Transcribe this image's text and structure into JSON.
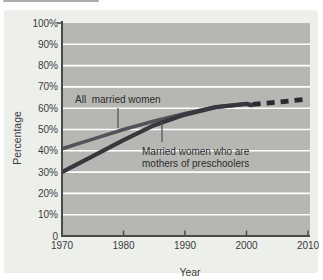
{
  "chart_data": {
    "type": "line",
    "title": "",
    "xlabel": "Year",
    "ylabel": "Percentage",
    "xlim": [
      1970,
      2010
    ],
    "ylim": [
      0,
      100
    ],
    "grid": "horizontal-white-gridlines",
    "legend_position": "inline-annotations",
    "xticks": [
      "1970",
      "1980",
      "1990",
      "2000",
      "2010"
    ],
    "xtick_values": [
      1970,
      1980,
      1990,
      2000,
      2010
    ],
    "yticks": [
      "100%",
      "90%",
      "80%",
      "70%",
      "60%",
      "50%",
      "40%",
      "30%",
      "20%",
      "10%",
      "0"
    ],
    "ytick_values": [
      100,
      90,
      80,
      70,
      60,
      50,
      40,
      30,
      20,
      10,
      0
    ],
    "colors": {
      "panel_bg": "#edefeb",
      "plot_bg": "#b6b7b3",
      "gridline": "#ffffff",
      "axis": "#4a4a48",
      "tick_text": "#3c3c3c",
      "annotation_text": "#2d2d2d",
      "leader_line": "#56525a"
    },
    "series": [
      {
        "name": "All married women",
        "style": "solid",
        "color": "#55515a",
        "width": 3.6,
        "x": [
          1970,
          1975,
          1980,
          1985,
          1990,
          1995,
          2000,
          2001
        ],
        "y": [
          41,
          45.5,
          50,
          54,
          57.5,
          60.5,
          62,
          61.3
        ]
      },
      {
        "name": "Married women who are mothers of preschoolers",
        "style": "solid",
        "color": "#39363e",
        "width": 4.2,
        "x": [
          1970,
          1975,
          1980,
          1985,
          1990,
          1995,
          2000,
          2001
        ],
        "y": [
          30,
          37.5,
          45,
          52,
          57,
          60.5,
          62,
          61.3
        ]
      },
      {
        "name": "Projection (dashed)",
        "style": "dashed",
        "color": "#2b2b2f",
        "width": 4.8,
        "x": [
          2001,
          2009.8
        ],
        "y": [
          61.8,
          64.2
        ]
      }
    ],
    "annotations": [
      {
        "text_lines": [
          "All  married women"
        ],
        "x": 75,
        "y": 103,
        "line_height": 11.5,
        "leader": {
          "x": 118,
          "y1": 108,
          "y2": 128
        }
      },
      {
        "text_lines": [
          "Married women who are",
          "mothers of preschoolers"
        ],
        "x": 142,
        "y": 155,
        "line_height": 11.5,
        "leader": {
          "x": 162,
          "y1": 122,
          "y2": 142
        }
      }
    ]
  }
}
